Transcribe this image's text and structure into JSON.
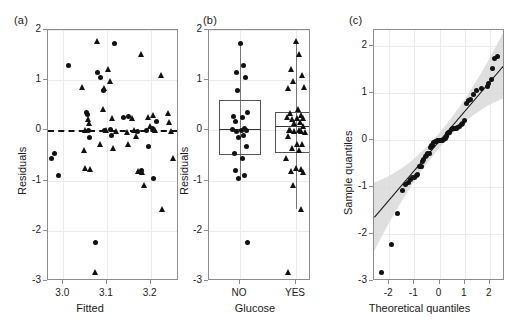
{
  "figure": {
    "panels": [
      {
        "tag": "(a)",
        "tag_x": 14,
        "tag_y": 16
      },
      {
        "tag": "(b)",
        "tag_x": 203,
        "tag_y": 16
      },
      {
        "tag": "(c)",
        "tag_x": 349,
        "tag_y": 16
      }
    ]
  },
  "chart_data": [
    {
      "type": "scatter",
      "panel": "(a)",
      "title": "",
      "xlabel": "Fitted",
      "ylabel": "Residuals",
      "xlim": [
        2.965,
        3.265
      ],
      "ylim": [
        -3,
        2
      ],
      "xticks": [
        3.0,
        3.1,
        3.2
      ],
      "xticklabels": [
        "3.0",
        "3.1",
        "3.2"
      ],
      "yticks": [
        -3,
        -2,
        -1,
        0,
        1,
        2
      ],
      "yticklabels": [
        "-3",
        "-2",
        "-1",
        "0",
        "1",
        "2"
      ],
      "grid": true,
      "legend": "none",
      "annotations": [
        {
          "type": "hline",
          "y": 0,
          "style": "dashed"
        }
      ],
      "series": [
        {
          "name": "Glucose NO",
          "marker": "circle",
          "points": [
            [
              2.973,
              -0.55
            ],
            [
              2.98,
              -0.46
            ],
            [
              2.99,
              -0.89
            ],
            [
              3.012,
              1.3
            ],
            [
              3.053,
              0.36
            ],
            [
              3.056,
              0.32
            ],
            [
              3.058,
              0.0
            ],
            [
              3.06,
              -0.15
            ],
            [
              3.074,
              -2.23
            ],
            [
              3.079,
              1.15
            ],
            [
              3.086,
              1.06
            ],
            [
              3.092,
              0.79
            ],
            [
              3.095,
              -0.01
            ],
            [
              3.108,
              0.01
            ],
            [
              3.11,
              -0.11
            ],
            [
              3.118,
              1.74
            ],
            [
              3.138,
              0.25
            ],
            [
              3.15,
              0.28
            ],
            [
              3.17,
              -0.02
            ],
            [
              3.178,
              -0.8
            ],
            [
              3.19,
              -0.01
            ],
            [
              3.196,
              -0.32
            ],
            [
              3.204,
              0.03
            ],
            [
              3.206,
              -0.95
            ],
            [
              3.214,
              0.17
            ]
          ]
        },
        {
          "name": "Glucose YES",
          "marker": "triangle",
          "points": [
            [
              3.045,
              0.86
            ],
            [
              3.049,
              -0.4
            ],
            [
              3.05,
              0.0
            ],
            [
              3.052,
              -0.74
            ],
            [
              3.058,
              0.22
            ],
            [
              3.061,
              0.15
            ],
            [
              3.063,
              -0.76
            ],
            [
              3.074,
              -2.82
            ],
            [
              3.078,
              1.79
            ],
            [
              3.086,
              -0.28
            ],
            [
              3.091,
              0.43
            ],
            [
              3.095,
              0.84
            ],
            [
              3.098,
              0.0
            ],
            [
              3.104,
              1.22
            ],
            [
              3.107,
              0.98
            ],
            [
              3.112,
              0.25
            ],
            [
              3.115,
              -0.35
            ],
            [
              3.122,
              -0.02
            ],
            [
              3.146,
              -0.04
            ],
            [
              3.15,
              -0.28
            ],
            [
              3.158,
              0.25
            ],
            [
              3.162,
              0.0
            ],
            [
              3.168,
              -0.12
            ],
            [
              3.172,
              -0.8
            ],
            [
              3.178,
              1.52
            ],
            [
              3.182,
              -0.83
            ],
            [
              3.186,
              -1.08
            ],
            [
              3.196,
              0.26
            ],
            [
              3.2,
              0.09
            ],
            [
              3.206,
              0.3
            ],
            [
              3.212,
              0.0
            ],
            [
              3.224,
              1.11
            ],
            [
              3.228,
              -1.57
            ],
            [
              3.24,
              0.34
            ],
            [
              3.244,
              0.17
            ],
            [
              3.248,
              -0.02
            ],
            [
              3.252,
              -0.55
            ]
          ]
        }
      ]
    },
    {
      "type": "boxplot",
      "panel": "(b)",
      "title": "",
      "xlabel": "Glucose",
      "ylabel": "Residuals",
      "ylim": [
        -3,
        2
      ],
      "yticks": [
        -3,
        -2,
        -1,
        0,
        1,
        2
      ],
      "yticklabels": [
        "-3",
        "-2",
        "-1",
        "0",
        "1",
        "2"
      ],
      "categories": [
        "NO",
        "YES"
      ],
      "grid": true,
      "boxes": [
        {
          "label": "NO",
          "marker": "circle",
          "q1": -0.5,
          "median": 0.03,
          "q3": 0.6,
          "whisker_low": -0.95,
          "whisker_high": 1.74,
          "points": [
            1.74,
            1.3,
            1.15,
            1.06,
            0.79,
            0.36,
            0.28,
            0.25,
            0.17,
            0.03,
            0.01,
            0.0,
            -0.01,
            -0.02,
            -0.11,
            -0.15,
            -0.32,
            -0.46,
            -0.55,
            -0.8,
            -0.89,
            -0.95,
            -2.23
          ]
        },
        {
          "label": "YES",
          "marker": "triangle",
          "q1": -0.45,
          "median": 0.08,
          "q3": 0.36,
          "whisker_low": -1.57,
          "whisker_high": 1.79,
          "points": [
            1.79,
            1.52,
            1.22,
            1.11,
            0.98,
            0.86,
            0.84,
            0.43,
            0.34,
            0.3,
            0.26,
            0.25,
            0.25,
            0.22,
            0.17,
            0.15,
            0.09,
            0.0,
            0.0,
            0.0,
            -0.02,
            -0.02,
            -0.04,
            -0.12,
            -0.28,
            -0.28,
            -0.35,
            -0.4,
            -0.55,
            -0.74,
            -0.76,
            -0.8,
            -0.83,
            -1.08,
            -1.57,
            -2.82
          ]
        }
      ]
    },
    {
      "type": "scatter",
      "panel": "(c)",
      "title": "",
      "xlabel": "Theoretical quantiles",
      "ylabel": "Sample quantiles",
      "xlim": [
        -2.6,
        2.6
      ],
      "ylim": [
        -3,
        2.35
      ],
      "xticks": [
        -2,
        -1,
        0,
        1,
        2
      ],
      "xticklabels": [
        "-2",
        "-1",
        "0",
        "1",
        "2"
      ],
      "yticks": [
        -3,
        -2,
        -1,
        0,
        1,
        2
      ],
      "yticklabels": [
        "-3",
        "-2",
        "-1",
        "0",
        "1",
        "2"
      ],
      "grid": true,
      "reference_line": {
        "intercept": 0.0,
        "slope": 0.63
      },
      "confidence_band": true,
      "points": [
        [
          -2.32,
          -2.82
        ],
        [
          -1.9,
          -2.23
        ],
        [
          -1.65,
          -1.57
        ],
        [
          -1.47,
          -1.08
        ],
        [
          -1.34,
          -0.95
        ],
        [
          -1.24,
          -0.89
        ],
        [
          -1.15,
          -0.83
        ],
        [
          -1.07,
          -0.8
        ],
        [
          -0.99,
          -0.8
        ],
        [
          -0.92,
          -0.76
        ],
        [
          -0.86,
          -0.74
        ],
        [
          -0.79,
          -0.55
        ],
        [
          -0.73,
          -0.55
        ],
        [
          -0.68,
          -0.46
        ],
        [
          -0.62,
          -0.4
        ],
        [
          -0.57,
          -0.35
        ],
        [
          -0.51,
          -0.32
        ],
        [
          -0.46,
          -0.28
        ],
        [
          -0.41,
          -0.28
        ],
        [
          -0.36,
          -0.15
        ],
        [
          -0.32,
          -0.12
        ],
        [
          -0.27,
          -0.11
        ],
        [
          -0.22,
          -0.04
        ],
        [
          -0.17,
          -0.02
        ],
        [
          -0.13,
          -0.02
        ],
        [
          -0.08,
          -0.01
        ],
        [
          -0.04,
          -0.01
        ],
        [
          0.0,
          0.0
        ],
        [
          0.04,
          0.0
        ],
        [
          0.08,
          0.0
        ],
        [
          0.13,
          0.0
        ],
        [
          0.17,
          0.01
        ],
        [
          0.22,
          0.03
        ],
        [
          0.27,
          0.09
        ],
        [
          0.32,
          0.15
        ],
        [
          0.36,
          0.17
        ],
        [
          0.41,
          0.17
        ],
        [
          0.46,
          0.22
        ],
        [
          0.51,
          0.25
        ],
        [
          0.57,
          0.25
        ],
        [
          0.62,
          0.25
        ],
        [
          0.68,
          0.26
        ],
        [
          0.73,
          0.28
        ],
        [
          0.79,
          0.3
        ],
        [
          0.86,
          0.34
        ],
        [
          0.92,
          0.36
        ],
        [
          0.99,
          0.43
        ],
        [
          1.07,
          0.79
        ],
        [
          1.15,
          0.84
        ],
        [
          1.24,
          0.86
        ],
        [
          1.34,
          0.98
        ],
        [
          1.47,
          1.06
        ],
        [
          1.65,
          1.11
        ],
        [
          1.9,
          1.15
        ],
        [
          1.93,
          1.22
        ],
        [
          2.05,
          1.3
        ],
        [
          2.1,
          1.52
        ],
        [
          2.18,
          1.74
        ],
        [
          2.32,
          1.79
        ]
      ]
    }
  ]
}
